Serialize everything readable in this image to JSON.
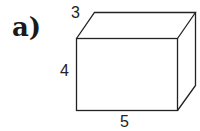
{
  "diagram": {
    "part_label": "a)",
    "shape": "rectangular-prism",
    "dimensions": {
      "depth": "3",
      "height": "4",
      "width": "5"
    },
    "stroke_color": "#222222",
    "background": "#ffffff"
  }
}
